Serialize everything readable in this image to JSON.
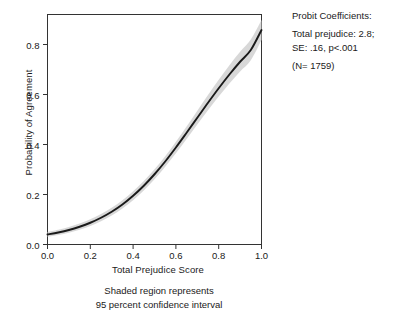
{
  "chart_data": {
    "type": "line",
    "title": "",
    "xlabel": "Total Prejudice Score",
    "ylabel": "Probability of Agreement",
    "xlim": [
      0.0,
      1.0
    ],
    "ylim": [
      0.0,
      0.92
    ],
    "grid": false,
    "legend": "none",
    "xticks": [
      "0.0",
      "0.2",
      "0.4",
      "0.6",
      "0.8",
      "1.0"
    ],
    "xtick_values": [
      0.0,
      0.2,
      0.4,
      0.6,
      0.8,
      1.0
    ],
    "yticks": [
      "0.0",
      "0.2",
      "0.4",
      "0.6",
      "0.8"
    ],
    "ytick_values": [
      0.0,
      0.2,
      0.4,
      0.6,
      0.8
    ],
    "series": [
      {
        "name": "Predicted probability of agreement",
        "x": [
          0.0,
          0.05,
          0.1,
          0.15,
          0.2,
          0.25,
          0.3,
          0.35,
          0.4,
          0.45,
          0.5,
          0.55,
          0.6,
          0.65,
          0.7,
          0.75,
          0.8,
          0.85,
          0.9,
          0.95,
          1.0
        ],
        "values": [
          0.04,
          0.048,
          0.058,
          0.071,
          0.087,
          0.107,
          0.131,
          0.16,
          0.195,
          0.235,
          0.281,
          0.332,
          0.388,
          0.447,
          0.507,
          0.567,
          0.625,
          0.68,
          0.731,
          0.778,
          0.858
        ]
      },
      {
        "name": "95 percent confidence interval upper bound",
        "x": [
          0.0,
          0.05,
          0.1,
          0.15,
          0.2,
          0.25,
          0.3,
          0.35,
          0.4,
          0.45,
          0.5,
          0.55,
          0.6,
          0.65,
          0.7,
          0.75,
          0.8,
          0.85,
          0.9,
          0.95,
          1.0
        ],
        "values": [
          0.05,
          0.059,
          0.07,
          0.084,
          0.101,
          0.122,
          0.147,
          0.177,
          0.213,
          0.254,
          0.301,
          0.353,
          0.411,
          0.472,
          0.535,
          0.598,
          0.659,
          0.717,
          0.771,
          0.82,
          0.898
        ]
      },
      {
        "name": "95 percent confidence interval lower bound",
        "x": [
          0.0,
          0.05,
          0.1,
          0.15,
          0.2,
          0.25,
          0.3,
          0.35,
          0.4,
          0.45,
          0.5,
          0.55,
          0.6,
          0.65,
          0.7,
          0.75,
          0.8,
          0.85,
          0.9,
          0.95,
          1.0
        ],
        "values": [
          0.031,
          0.038,
          0.047,
          0.059,
          0.074,
          0.093,
          0.116,
          0.144,
          0.177,
          0.216,
          0.261,
          0.311,
          0.365,
          0.422,
          0.48,
          0.537,
          0.592,
          0.644,
          0.692,
          0.737,
          0.818
        ]
      }
    ],
    "annotations": {
      "heading": "Probit Coefficients:",
      "lines": [
        "Total prejudice: 2.8;",
        "SE: .16, p<.001",
        "(N= 1759)"
      ],
      "coefficient_label": "Total prejudice",
      "coefficient_value": "2.8",
      "se_value": ".16",
      "p_value": "p<.001",
      "n_label": "(N= 1759)",
      "n_value": "1759"
    },
    "caption": [
      "Shaded region represents",
      "95 percent confidence interval"
    ],
    "colors": {
      "line": "#1a1a1a",
      "band": "#d4d4d4",
      "axis": "#333333",
      "background": "#ffffff",
      "text": "#1a1a1a"
    }
  }
}
